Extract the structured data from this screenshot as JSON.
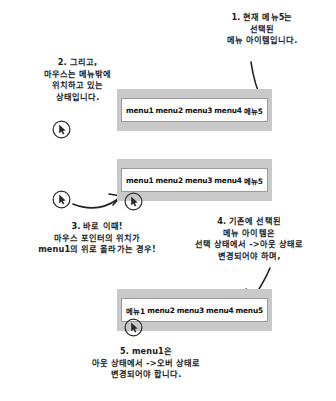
{
  "figure": {
    "language": "Korean"
  },
  "notes": {
    "n1": "1. 현재 메뉴5는\n선택된\n메뉴 아이템입니다.",
    "n2": "2. 그리고,\n마우스는 메뉴밖에\n위치하고 있는\n상태입니다.",
    "n3": "3. 바로 이때!\n마우스 포인터의 위치가\nmenu1의 위로 올라가는 경우!",
    "n4": "4. 기존에 선택된\n메뉴 아이템은\n선택 상태에서 ->아웃 상태로\n변경되어야 하며,",
    "n5": "5. menu1은\n아웃 상태에서 ->오버 상태로\n변경되어야 합니다."
  },
  "menubars": [
    {
      "id": "menubar-top",
      "items": [
        {
          "label": "menu1",
          "state": "out",
          "script": "latin"
        },
        {
          "label": "menu2",
          "state": "out",
          "script": "latin"
        },
        {
          "label": "menu3",
          "state": "out",
          "script": "latin"
        },
        {
          "label": "menu4",
          "state": "out",
          "script": "latin"
        },
        {
          "label": "메뉴5",
          "state": "selected",
          "script": "hangul"
        }
      ]
    },
    {
      "id": "menubar-middle",
      "items": [
        {
          "label": "menu1",
          "state": "out",
          "script": "latin"
        },
        {
          "label": "menu2",
          "state": "out",
          "script": "latin"
        },
        {
          "label": "menu3",
          "state": "out",
          "script": "latin"
        },
        {
          "label": "menu4",
          "state": "out",
          "script": "latin"
        },
        {
          "label": "메뉴5",
          "state": "selected",
          "script": "hangul"
        }
      ]
    },
    {
      "id": "menubar-bottom",
      "items": [
        {
          "label": "메뉴1",
          "state": "over",
          "script": "hangul"
        },
        {
          "label": "menu2",
          "state": "out",
          "script": "latin"
        },
        {
          "label": "menu3",
          "state": "out",
          "script": "latin"
        },
        {
          "label": "menu4",
          "state": "out",
          "script": "latin"
        },
        {
          "label": "menu5",
          "state": "out",
          "script": "latin"
        }
      ]
    }
  ],
  "cursors": [
    {
      "id": "cursor-outside-top",
      "icon": "mouse-pointer-icon",
      "position": "outside-menubar"
    },
    {
      "id": "cursor-outside-middle",
      "icon": "mouse-pointer-icon",
      "position": "outside-menubar"
    },
    {
      "id": "cursor-over-menu1-middle",
      "icon": "mouse-pointer-icon",
      "position": "over-menu1"
    },
    {
      "id": "cursor-over-menu1-bottom",
      "icon": "mouse-pointer-icon",
      "position": "over-menu1"
    }
  ],
  "arrows": [
    {
      "id": "arrow-note1-to-menu5",
      "from": "note-1",
      "to": "menubar-top-menu5",
      "style": "curved"
    },
    {
      "id": "arrow-cursor-move",
      "from": "cursor-outside-middle",
      "to": "cursor-over-menu1-middle",
      "style": "curved"
    },
    {
      "id": "arrow-note4-to-menu5",
      "from": "note-4",
      "to": "menubar-bottom-menu5",
      "style": "straight"
    }
  ],
  "colors": {
    "page_background": "#ffffff",
    "menubar_frame": "#c9c9c9",
    "menubar_inner": "#ffffff",
    "ink": "#1b1b1b"
  }
}
